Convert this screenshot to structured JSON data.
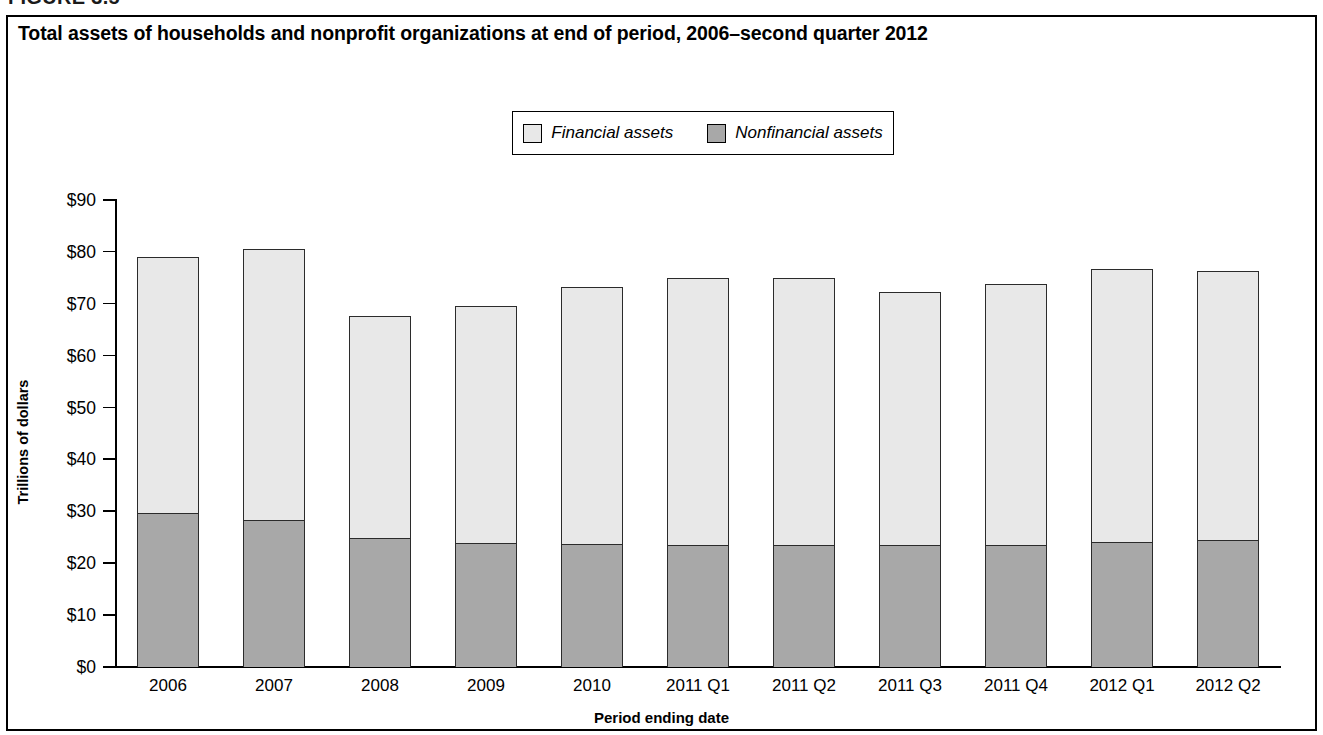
{
  "figure": {
    "label": "FIGURE 3.5",
    "title": "Total assets of households and nonprofit organizations at end of period, 2006–second quarter 2012"
  },
  "legend": {
    "position": "top-center",
    "items": [
      {
        "label": "Financial assets",
        "color": "#e8e8e8",
        "icon": "square-swatch-light"
      },
      {
        "label": "Nonfinancial assets",
        "color": "#a8a8a8",
        "icon": "square-swatch-dark"
      }
    ]
  },
  "axes": {
    "y_title": "Trillions of dollars",
    "x_title": "Period ending date",
    "y_ticks": [
      "$0",
      "$10",
      "$20",
      "$30",
      "$40",
      "$50",
      "$60",
      "$70",
      "$80",
      "$90"
    ]
  },
  "colors": {
    "financial": "#e8e8e8",
    "nonfinancial": "#a8a8a8",
    "outline": "#2b2b2b",
    "frame": "#000000",
    "background": "#ffffff"
  },
  "chart_data": {
    "type": "bar",
    "stacked": true,
    "title": "Total assets of households and nonprofit organizations at end of period, 2006–second quarter 2012",
    "xlabel": "Period ending date",
    "ylabel": "Trillions of dollars",
    "ylim": [
      0,
      90
    ],
    "ytick_step": 10,
    "grid": false,
    "legend_position": "top-center",
    "categories": [
      "2006",
      "2007",
      "2008",
      "2009",
      "2010",
      "2011 Q1",
      "2011 Q2",
      "2011 Q3",
      "2011 Q4",
      "2012 Q1",
      "2012 Q2"
    ],
    "series": [
      {
        "name": "Nonfinancial assets",
        "color": "#a8a8a8",
        "values": [
          29.6,
          28.4,
          24.9,
          23.9,
          23.7,
          23.5,
          23.5,
          23.5,
          23.6,
          24.1,
          24.5
        ]
      },
      {
        "name": "Financial assets",
        "color": "#e8e8e8",
        "values": [
          49.4,
          52.1,
          42.7,
          45.7,
          49.5,
          51.4,
          51.4,
          48.8,
          50.3,
          52.6,
          51.9
        ]
      }
    ],
    "totals": [
      79.0,
      80.5,
      67.6,
      69.6,
      73.2,
      74.9,
      74.9,
      72.3,
      73.9,
      76.7,
      76.4
    ]
  }
}
